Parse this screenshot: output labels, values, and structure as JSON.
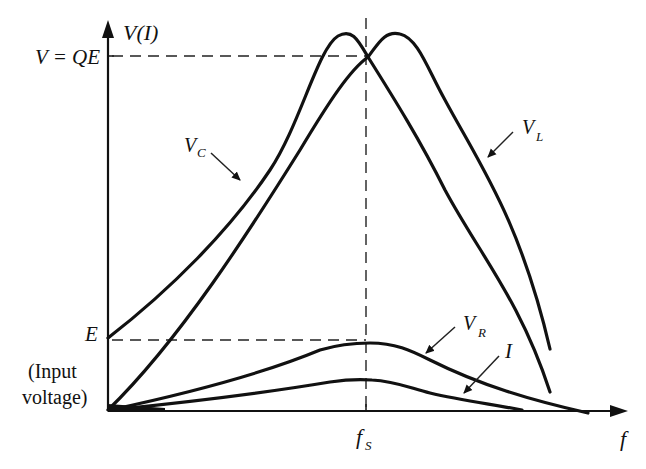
{
  "figure": {
    "y_axis_label": "V(I)",
    "x_axis_label": "f",
    "resonance_marker": {
      "main": "f",
      "sub": "S"
    },
    "peak_label": "V = QE",
    "input_label": {
      "symbol": "E",
      "line1": "(Input",
      "line2": "voltage)"
    },
    "curve_labels": {
      "vc": {
        "main": "V",
        "sub": "C"
      },
      "vl": {
        "main": "V",
        "sub": "L"
      },
      "vr": {
        "main": "V",
        "sub": "R"
      },
      "i": {
        "main": "I"
      }
    },
    "colors": {
      "ink": "#111111",
      "background": "#ffffff"
    }
  }
}
